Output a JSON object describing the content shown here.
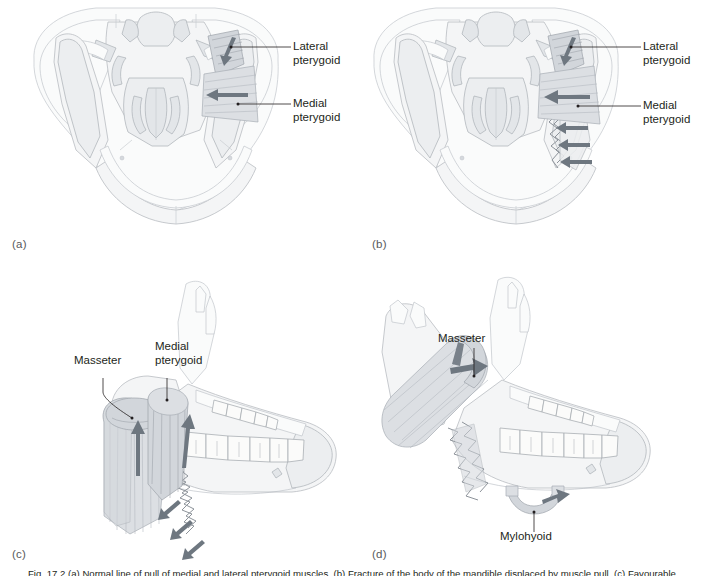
{
  "figure": {
    "caption": "Fig. 17.2   (a) Normal line of pull of medial and lateral pterygoid muscles. (b) Fracture of the body of the mandible displaced by muscle pull. (c) Favourable fracture of the angle resisted by the masseter and medial pterygoid. (d) Unfavourable fracture of the angle displaced upwards by the masseter and downwards by the mylohyoid.",
    "accent_color": "#6e7780",
    "bone_color": "#f4f5f6",
    "muscle_color": "#dcdfe3",
    "label_color": "#231f20"
  },
  "panels": [
    {
      "id": "a",
      "letter": "(a)",
      "view": "inferior-view-of-skull-and-mandible",
      "labels": [
        {
          "name": "lateral-pterygoid",
          "text": "Lateral\npterygoid"
        },
        {
          "name": "medial-pterygoid",
          "text": "Medial\npterygoid"
        }
      ],
      "arrows": [
        {
          "name": "lateral-pterygoid-pull-arrow",
          "direction": "down-left"
        },
        {
          "name": "medial-pterygoid-pull-arrow",
          "direction": "left"
        }
      ],
      "fracture": false
    },
    {
      "id": "b",
      "letter": "(b)",
      "view": "inferior-view-of-skull-and-mandible-with-fracture",
      "labels": [
        {
          "name": "lateral-pterygoid",
          "text": "Lateral\npterygoid"
        },
        {
          "name": "medial-pterygoid",
          "text": "Medial\npterygoid"
        }
      ],
      "arrows": [
        {
          "name": "lateral-pterygoid-pull-arrow",
          "direction": "down-left"
        },
        {
          "name": "medial-pterygoid-pull-arrow",
          "direction": "left"
        },
        {
          "name": "fracture-displacement-arrow-1",
          "direction": "left"
        },
        {
          "name": "fracture-displacement-arrow-2",
          "direction": "left"
        },
        {
          "name": "fracture-displacement-arrow-3",
          "direction": "left"
        }
      ],
      "fracture": true
    },
    {
      "id": "c",
      "letter": "(c)",
      "view": "lateral-oblique-mandible-favourable-fracture",
      "labels": [
        {
          "name": "masseter",
          "text": "Masseter"
        },
        {
          "name": "medial-pterygoid",
          "text": "Medial\npterygoid"
        }
      ],
      "arrows": [
        {
          "name": "masseter-pull-arrow",
          "direction": "up"
        },
        {
          "name": "medial-pterygoid-pull-arrow",
          "direction": "up"
        },
        {
          "name": "fracture-arrow-1",
          "direction": "up-left"
        },
        {
          "name": "fracture-arrow-2",
          "direction": "up-left"
        },
        {
          "name": "fracture-arrow-3",
          "direction": "up-left"
        }
      ],
      "fracture": true
    },
    {
      "id": "d",
      "letter": "(d)",
      "view": "lateral-oblique-mandible-unfavourable-fracture",
      "labels": [
        {
          "name": "masseter",
          "text": "Masseter"
        },
        {
          "name": "mylohyoid",
          "text": "Mylohyoid"
        }
      ],
      "arrows": [
        {
          "name": "masseter-displacement-arrow",
          "direction": "right"
        },
        {
          "name": "mylohyoid-displacement-arrow",
          "direction": "right"
        }
      ],
      "fracture": true
    }
  ]
}
